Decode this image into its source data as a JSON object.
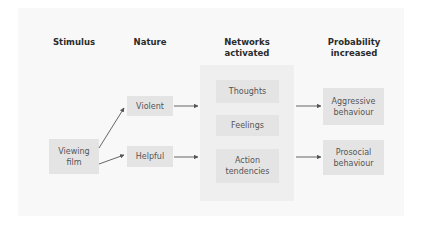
{
  "headers": {
    "stimulus": "Stimulus",
    "nature": "Nature",
    "networks_line1": "Networks",
    "networks_line2": "activated",
    "probability_line1": "Probability",
    "probability_line2": "increased"
  },
  "nodes": {
    "stimulus": {
      "line1": "Viewing",
      "line2": "film"
    },
    "violent": "Violent",
    "helpful": "Helpful",
    "thoughts": "Thoughts",
    "feelings": "Feelings",
    "action": {
      "line1": "Action",
      "line2": "tendencies"
    },
    "aggressive": {
      "line1": "Aggressive",
      "line2": "behaviour"
    },
    "prosocial": {
      "line1": "Prosocial",
      "line2": "behaviour"
    }
  },
  "edges": [
    {
      "from": "Viewing film",
      "to": "Violent"
    },
    {
      "from": "Viewing film",
      "to": "Helpful"
    },
    {
      "from": "Violent",
      "to": "Networks activated"
    },
    {
      "from": "Helpful",
      "to": "Networks activated"
    },
    {
      "from": "Networks activated",
      "to": "Aggressive behaviour"
    },
    {
      "from": "Networks activated",
      "to": "Prosocial behaviour"
    }
  ],
  "colors": {
    "background": "#ffffff",
    "panel": "#f8f8f8",
    "network_panel": "#efefef",
    "box": "#e4e4e4",
    "arrow": "#555555",
    "header_text": "#2b2b2b",
    "box_text": "#555555"
  }
}
